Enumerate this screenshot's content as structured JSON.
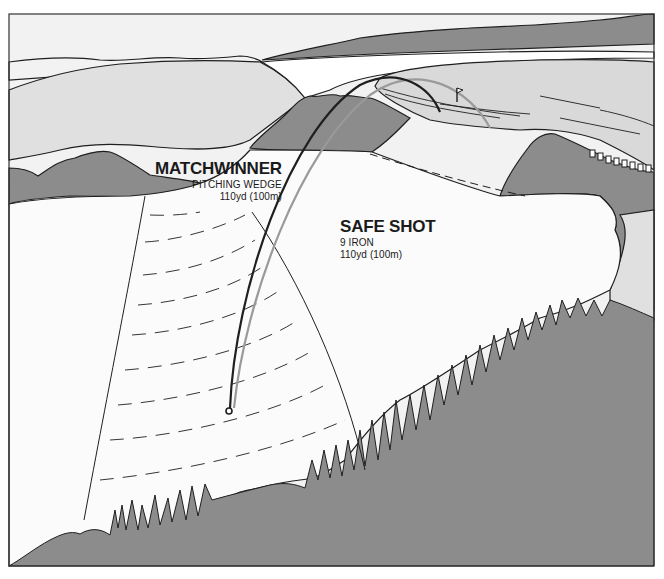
{
  "illustration": {
    "subject": "Golf approach shot comparison",
    "colors": {
      "sky": "#f2f2f2",
      "light_land": "#e0e0e0",
      "dark_land": "#8c8c8c",
      "fairway": "#fbfbfb",
      "green": "#d9d9d9",
      "outline": "#1f1f1f",
      "matchwinner_trajectory": "#1f1f1f",
      "safe_shot_trajectory": "#9a9a9a"
    }
  },
  "shots": [
    {
      "name": "MATCHWINNER",
      "club": "PITCHING WEDGE",
      "distance": "110yd (100m)"
    },
    {
      "name": "SAFE SHOT",
      "club": "9 IRON",
      "distance": "110yd (100m)"
    }
  ],
  "markers": {
    "ball": "ball-start-icon",
    "flag": "pin-flag-icon"
  }
}
